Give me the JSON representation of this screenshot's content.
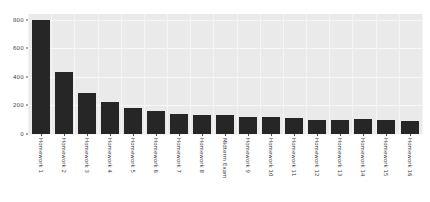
{
  "chart_data": {
    "type": "bar",
    "title": "",
    "xlabel": "",
    "ylabel": "",
    "ylim": [
      0,
      840
    ],
    "grid": true,
    "legend": "none",
    "bar_color": "#262626",
    "plot_background": "#eaeaea",
    "yticks": [
      0,
      200,
      400,
      600,
      800
    ],
    "ytick_labels": [
      "0",
      "200",
      "400",
      "600",
      "800"
    ],
    "categories": [
      "Homework 1",
      "Homework 2",
      "Homework 3",
      "Homework 4",
      "Homework 5",
      "Homework 6",
      "Homework 7",
      "Homework 8",
      "Midterm Exam",
      "Homework 9",
      "Homework 10",
      "Homework 11",
      "Homework 12",
      "Homework 13",
      "Homework 14",
      "Homework 15",
      "Homework 16"
    ],
    "values": [
      800,
      437,
      290,
      227,
      185,
      160,
      137,
      130,
      136,
      118,
      117,
      112,
      100,
      96,
      103,
      96,
      90
    ]
  },
  "caption": ""
}
